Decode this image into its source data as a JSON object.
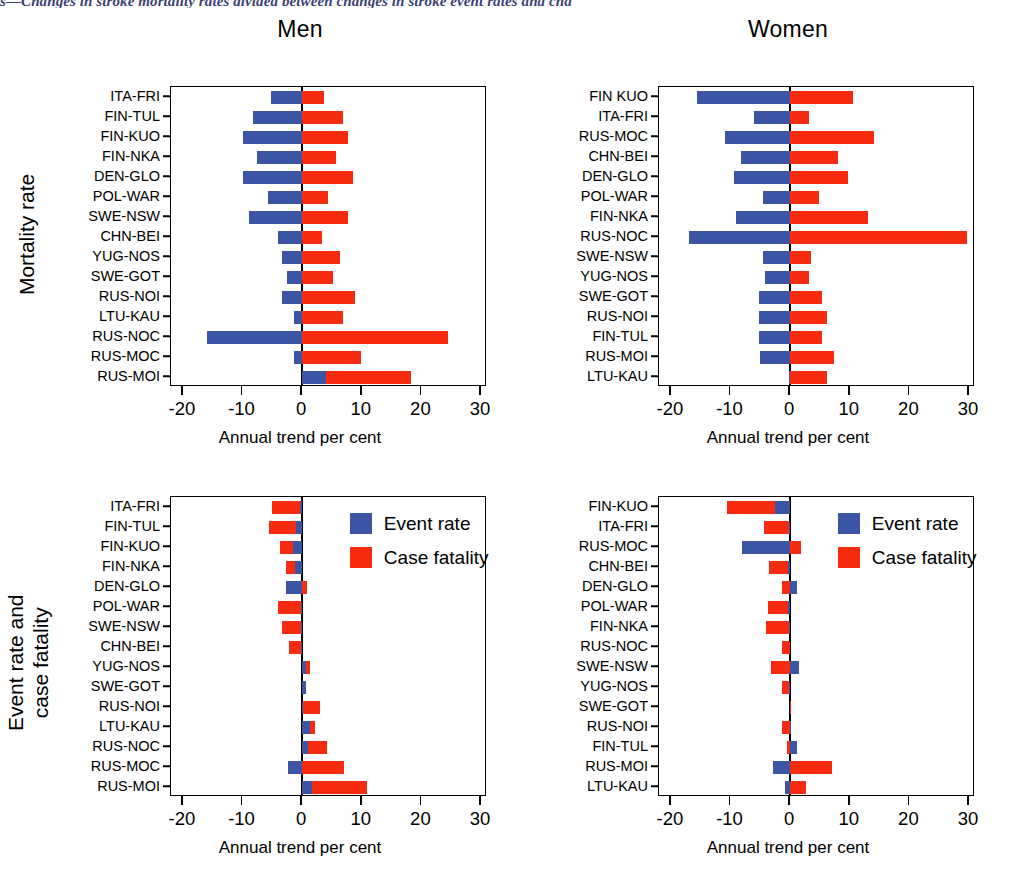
{
  "caption": "s—Changes in stroke mortality rates divided between changes in stroke event rates and cha",
  "colors": {
    "event_rate": "#3b55a4",
    "case_fatality": "#f62b10",
    "caption": "#3b3f77"
  },
  "legend": {
    "items": [
      {
        "label": "Event rate",
        "color_key": "event_rate"
      },
      {
        "label": "Case fatality",
        "color_key": "case_fatality"
      }
    ]
  },
  "rows": [
    {
      "label": "Mortality rate"
    },
    {
      "label_line1": "Event rate and",
      "label_line2": "case fatality"
    }
  ],
  "axis": {
    "xlabel_men": "Annual trend per cent",
    "xlabel_women": "Annual  trend per cent",
    "ticks": [
      -20,
      -10,
      0,
      10,
      20,
      30
    ],
    "tick_labels": [
      "-20",
      "-10",
      "0",
      "10",
      "20",
      "30"
    ],
    "xlim": [
      -22,
      31
    ]
  },
  "chart_data": [
    {
      "id": "mortality-men",
      "type": "bar",
      "orientation": "horizontal",
      "stacked": true,
      "title": "Men",
      "panel_row": "Mortality rate",
      "xlabel": "Annual trend per cent",
      "ylabel": "",
      "xlim": [
        -22,
        31
      ],
      "grid": false,
      "legend_position": "none",
      "categories": [
        "ITA-FRI",
        "FIN-TUL",
        "FIN-KUO",
        "FIN-NKA",
        "DEN-GLO",
        "POL-WAR",
        "SWE-NSW",
        "CHN-BEI",
        "YUG-NOS",
        "SWE-GOT",
        "RUS-NOI",
        "LTU-KAU",
        "RUS-NOC",
        "RUS-MOC",
        "RUS-MOI"
      ],
      "series": [
        {
          "name": "Event rate",
          "values": [
            -5.2,
            -8.2,
            -9.9,
            -7.5,
            -10.0,
            -5.8,
            -9.0,
            -4.0,
            -3.4,
            -2.5,
            -3.4,
            -1.4,
            -16.0,
            -1.4,
            4.0
          ]
        },
        {
          "name": "Case fatality",
          "values": [
            3.6,
            6.9,
            7.7,
            5.7,
            8.5,
            4.4,
            7.7,
            3.3,
            6.3,
            5.2,
            8.8,
            6.9,
            24.4,
            9.9,
            14.3
          ]
        }
      ]
    },
    {
      "id": "mortality-women",
      "type": "bar",
      "orientation": "horizontal",
      "stacked": true,
      "title": "Women",
      "panel_row": "Mortality rate",
      "xlabel": "Annual  trend per cent",
      "ylabel": "",
      "xlim": [
        -22,
        31
      ],
      "grid": false,
      "legend_position": "none",
      "categories": [
        "FIN KUO",
        "ITA-FRI",
        "RUS-MOC",
        "CHN-BEI",
        "DEN-GLO",
        "POL-WAR",
        "FIN-NKA",
        "RUS-NOC",
        "SWE-NSW",
        "YUG-NOS",
        "SWE-GOT",
        "RUS-NOI",
        "FIN-TUL",
        "RUS-MOI",
        "LTU-KAU"
      ],
      "series": [
        {
          "name": "Event rate",
          "values": [
            -15.7,
            -6.1,
            -10.9,
            -8.2,
            -9.5,
            -4.5,
            -9.1,
            -17.0,
            -4.6,
            -4.2,
            -5.3,
            -5.3,
            -5.3,
            -5.1,
            -0.2
          ]
        },
        {
          "name": "Case fatality",
          "values": [
            10.6,
            3.2,
            14.0,
            8.1,
            9.7,
            4.8,
            13.0,
            29.6,
            3.5,
            3.1,
            5.3,
            6.1,
            5.3,
            7.4,
            6.2
          ]
        }
      ]
    },
    {
      "id": "eventrate-casefatality-men",
      "type": "bar",
      "orientation": "horizontal",
      "stacked": false,
      "title": "Men",
      "panel_row": "Event rate and case fatality",
      "xlabel": "Annual trend per cent",
      "ylabel": "",
      "xlim": [
        -22,
        31
      ],
      "grid": false,
      "legend_position": "upper right",
      "categories": [
        "ITA-FRI",
        "FIN-TUL",
        "FIN-KUO",
        "FIN-NKA",
        "DEN-GLO",
        "POL-WAR",
        "SWE-NSW",
        "CHN-BEI",
        "YUG-NOS",
        "SWE-GOT",
        "RUS-NOI",
        "LTU-KAU",
        "RUS-NOC",
        "RUS-MOC",
        "RUS-MOI"
      ],
      "series": [
        {
          "name": "Event rate",
          "values": [
            -0.3,
            -1.1,
            -1.5,
            -1.2,
            -2.7,
            -0.2,
            -0.2,
            -0.2,
            0.7,
            0.7,
            0.2,
            1.3,
            1.0,
            -2.4,
            1.6
          ]
        },
        {
          "name": "Case fatality",
          "values": [
            -5.1,
            -5.5,
            -3.8,
            -2.7,
            0.8,
            -4.1,
            -3.4,
            -2.2,
            1.3,
            0.3,
            3.0,
            2.2,
            4.2,
            7.0,
            10.8
          ]
        }
      ]
    },
    {
      "id": "eventrate-casefatality-women",
      "type": "bar",
      "orientation": "horizontal",
      "stacked": false,
      "title": "Women",
      "panel_row": "Event rate and case fatality",
      "xlabel": "Annual trend per cent",
      "ylabel": "",
      "xlim": [
        -22,
        31
      ],
      "grid": false,
      "legend_position": "upper right",
      "categories": [
        "FIN-KUO",
        "ITA-FRI",
        "RUS-MOC",
        "CHN-BEI",
        "DEN-GLO",
        "POL-WAR",
        "FIN-NKA",
        "RUS-NOC",
        "SWE-NSW",
        "YUG-NOS",
        "SWE-GOT",
        "RUS-NOI",
        "FIN-TUL",
        "RUS-MOI",
        "LTU-KAU"
      ],
      "series": [
        {
          "name": "Event rate",
          "values": [
            -2.6,
            -0.2,
            -8.0,
            -0.3,
            1.2,
            -0.4,
            -0.2,
            0.0,
            1.5,
            -0.2,
            0.0,
            -0.1,
            1.2,
            -2.8,
            -0.9
          ]
        },
        {
          "name": "Case fatality",
          "values": [
            -10.6,
            -4.4,
            1.8,
            -3.5,
            -1.4,
            -3.8,
            -4.0,
            -1.3,
            -3.2,
            -1.3,
            -0.1,
            -1.3,
            -0.5,
            7.0,
            2.6
          ]
        }
      ]
    }
  ],
  "panels": {
    "men_title": "Men",
    "women_title": "Women"
  }
}
